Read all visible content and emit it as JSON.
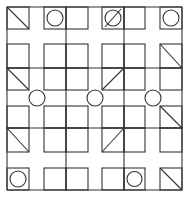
{
  "figure": {
    "stroke_color": "#333333",
    "background": "#ffffff",
    "border": {
      "x": 7,
      "y": 7,
      "w": 175,
      "h": 183
    },
    "squares": [
      {
        "x": 7,
        "y": 7,
        "w": 22,
        "h": 22,
        "mark": "diag-down"
      },
      {
        "x": 44,
        "y": 7,
        "w": 22,
        "h": 22,
        "mark": "circle"
      },
      {
        "x": 66,
        "y": 7,
        "w": 22,
        "h": 22,
        "mark": "none"
      },
      {
        "x": 102,
        "y": 7,
        "w": 22,
        "h": 22,
        "mark": "circle-slash"
      },
      {
        "x": 124,
        "y": 7,
        "w": 21,
        "h": 22,
        "mark": "none"
      },
      {
        "x": 160,
        "y": 7,
        "w": 22,
        "h": 22,
        "mark": "circle"
      },
      {
        "x": 7,
        "y": 44,
        "w": 22,
        "h": 24,
        "mark": "none"
      },
      {
        "x": 44,
        "y": 44,
        "w": 22,
        "h": 24,
        "mark": "none"
      },
      {
        "x": 66,
        "y": 44,
        "w": 22,
        "h": 24,
        "mark": "none"
      },
      {
        "x": 102,
        "y": 44,
        "w": 22,
        "h": 24,
        "mark": "none"
      },
      {
        "x": 124,
        "y": 44,
        "w": 21,
        "h": 24,
        "mark": "none"
      },
      {
        "x": 160,
        "y": 44,
        "w": 22,
        "h": 24,
        "mark": "diag-down"
      },
      {
        "x": 7,
        "y": 68,
        "w": 22,
        "h": 22,
        "mark": "diag-down"
      },
      {
        "x": 44,
        "y": 68,
        "w": 22,
        "h": 22,
        "mark": "none"
      },
      {
        "x": 66,
        "y": 68,
        "w": 22,
        "h": 22,
        "mark": "none"
      },
      {
        "x": 102,
        "y": 68,
        "w": 22,
        "h": 22,
        "mark": "diag-up"
      },
      {
        "x": 124,
        "y": 68,
        "w": 21,
        "h": 22,
        "mark": "none"
      },
      {
        "x": 160,
        "y": 68,
        "w": 22,
        "h": 22,
        "mark": "none"
      },
      {
        "x": 7,
        "y": 106,
        "w": 22,
        "h": 22,
        "mark": "none"
      },
      {
        "x": 44,
        "y": 106,
        "w": 22,
        "h": 22,
        "mark": "none"
      },
      {
        "x": 66,
        "y": 106,
        "w": 22,
        "h": 22,
        "mark": "none"
      },
      {
        "x": 102,
        "y": 106,
        "w": 22,
        "h": 22,
        "mark": "none"
      },
      {
        "x": 124,
        "y": 106,
        "w": 21,
        "h": 22,
        "mark": "none"
      },
      {
        "x": 160,
        "y": 106,
        "w": 22,
        "h": 22,
        "mark": "diag-down"
      },
      {
        "x": 7,
        "y": 128,
        "w": 22,
        "h": 24,
        "mark": "diag-down"
      },
      {
        "x": 44,
        "y": 128,
        "w": 22,
        "h": 24,
        "mark": "none"
      },
      {
        "x": 66,
        "y": 128,
        "w": 22,
        "h": 24,
        "mark": "none"
      },
      {
        "x": 102,
        "y": 128,
        "w": 22,
        "h": 24,
        "mark": "diag-up"
      },
      {
        "x": 124,
        "y": 128,
        "w": 21,
        "h": 24,
        "mark": "none"
      },
      {
        "x": 160,
        "y": 128,
        "w": 22,
        "h": 24,
        "mark": "none"
      },
      {
        "x": 7,
        "y": 168,
        "w": 22,
        "h": 22,
        "mark": "circle"
      },
      {
        "x": 66,
        "y": 168,
        "w": 22,
        "h": 22,
        "mark": "none"
      },
      {
        "x": 102,
        "y": 168,
        "w": 22,
        "h": 22,
        "mark": "none"
      },
      {
        "x": 124,
        "y": 168,
        "w": 21,
        "h": 22,
        "mark": "circle"
      },
      {
        "x": 160,
        "y": 168,
        "w": 22,
        "h": 22,
        "mark": "diag-down"
      },
      {
        "x": 44,
        "y": 168,
        "w": 22,
        "h": 22,
        "mark": "none"
      }
    ],
    "bottom_circles": [
      {
        "cx": 77,
        "cy": 179,
        "r": 7
      }
    ],
    "grid_lines": [
      {
        "x1": 7,
        "y1": 7,
        "x2": 182,
        "y2": 7
      },
      {
        "x1": 7,
        "y1": 190,
        "x2": 182,
        "y2": 190
      },
      {
        "x1": 7,
        "y1": 7,
        "x2": 7,
        "y2": 190
      },
      {
        "x1": 182,
        "y1": 7,
        "x2": 182,
        "y2": 190
      },
      {
        "x1": 66,
        "y1": 7,
        "x2": 66,
        "y2": 190
      },
      {
        "x1": 124,
        "y1": 7,
        "x2": 124,
        "y2": 190
      },
      {
        "x1": 7,
        "y1": 68,
        "x2": 182,
        "y2": 68
      },
      {
        "x1": 7,
        "y1": 128,
        "x2": 182,
        "y2": 128
      }
    ],
    "center_circles": [
      {
        "cx": 37,
        "cy": 98,
        "r": 8
      },
      {
        "cx": 95,
        "cy": 98,
        "r": 8
      },
      {
        "cx": 153,
        "cy": 98,
        "r": 8
      }
    ]
  }
}
